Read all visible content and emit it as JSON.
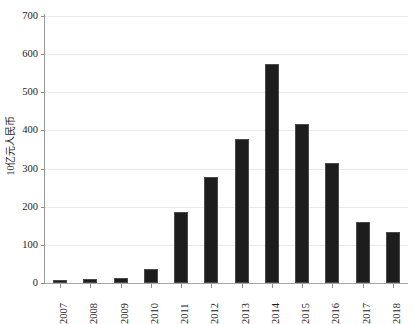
{
  "chart_data": {
    "type": "bar",
    "title": "",
    "subtitle": "",
    "xlabel": "",
    "ylabel": "10亿元人民币",
    "categories": [
      "2007",
      "2008",
      "2009",
      "2010",
      "2011",
      "2012",
      "2013",
      "2014",
      "2015",
      "2016",
      "2017",
      "2018"
    ],
    "values": [
      8,
      11,
      14,
      38,
      187,
      277,
      378,
      575,
      418,
      314,
      160,
      133
    ],
    "series": [
      {
        "name": "",
        "values": [
          8,
          11,
          14,
          38,
          187,
          277,
          378,
          575,
          418,
          314,
          160,
          133
        ]
      }
    ],
    "ylim": [
      0,
      700
    ],
    "yticks": [
      0,
      100,
      200,
      300,
      400,
      500,
      600,
      700
    ],
    "ytick_labels": [
      "0",
      "100",
      "200",
      "300",
      "400",
      "500",
      "600",
      "700"
    ],
    "grid": true,
    "grid_axis": "y",
    "legend": false,
    "legend_position": "none",
    "bar_color": "#1d1d1d",
    "grid_color": "#e9e9ea",
    "axis_color": "#9a9a9c",
    "text_color": "#1c1c1c",
    "background_color": "#ffffff",
    "xtick_rotation": 90,
    "annotations": []
  },
  "axes": {
    "y_title": "10亿元人民币"
  }
}
